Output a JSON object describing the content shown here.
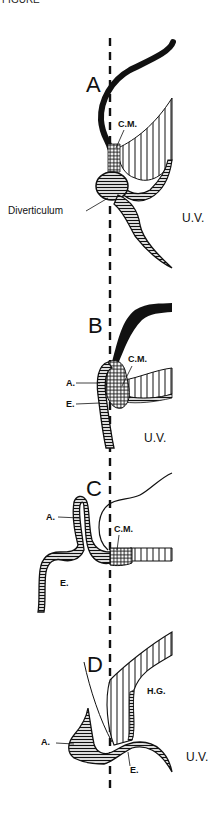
{
  "figure": {
    "top_fragment": "FIGURE",
    "midline": {
      "style": "dashed",
      "x": 110
    },
    "panels": [
      {
        "id": "A",
        "label": "A",
        "annotations": [
          "C.M.",
          "Diverticulum",
          "U.V."
        ]
      },
      {
        "id": "B",
        "label": "B",
        "annotations": [
          "C.M.",
          "A.",
          "E.",
          "U.V."
        ]
      },
      {
        "id": "C",
        "label": "C",
        "annotations": [
          "A.",
          "C.M.",
          "E."
        ]
      },
      {
        "id": "D",
        "label": "D",
        "annotations": [
          "H.G.",
          "A.",
          "E.",
          "U.V."
        ]
      }
    ],
    "hatching_legend": {
      "cross_hatch": "C.M.",
      "horizontal_hatch": "endoderm/epithelium",
      "vertical_hatch": "gut wall"
    }
  }
}
